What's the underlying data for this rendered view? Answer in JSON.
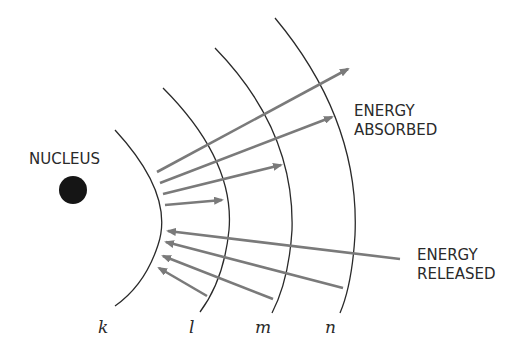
{
  "labels": {
    "nucleus": "NUCLEUS",
    "energy_absorbed_line1": "ENERGY",
    "energy_absorbed_line2": "ABSORBED",
    "energy_released_line1": "ENERGY",
    "energy_released_line2": "RELEASED"
  },
  "shells": [
    {
      "id": "k",
      "label": "k"
    },
    {
      "id": "l",
      "label": "l"
    },
    {
      "id": "m",
      "label": "m"
    },
    {
      "id": "n",
      "label": "n"
    }
  ],
  "arrows": {
    "absorbed_count": 4,
    "released_count": 4
  },
  "colors": {
    "shell": "#2a2a2a",
    "arrow": "#7a7a7a",
    "nucleus": "#151515",
    "text": "#2a2a2a"
  }
}
